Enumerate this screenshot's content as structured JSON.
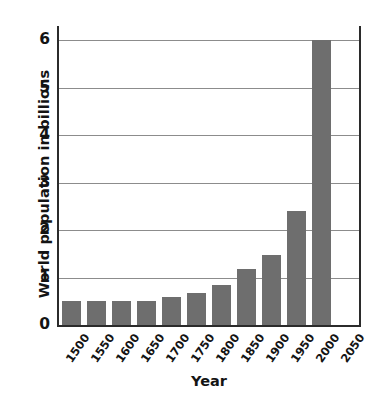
{
  "chart_data": {
    "type": "bar",
    "title": "",
    "xlabel": "Year",
    "ylabel": "World population in billions",
    "categories": [
      "1500",
      "1550",
      "1600",
      "1650",
      "1700",
      "1750",
      "1800",
      "1850",
      "1900",
      "1950",
      "2000",
      "2050"
    ],
    "values": [
      0.5,
      0.5,
      0.5,
      0.5,
      0.58,
      0.68,
      0.85,
      1.17,
      1.47,
      2.4,
      6.0,
      null
    ],
    "ylim": [
      0,
      6.3
    ],
    "ytick_labels": [
      "0",
      "1",
      "2",
      "3",
      "4",
      "5",
      "6"
    ],
    "ytick_values": [
      0,
      1,
      2,
      3,
      4,
      5,
      6
    ],
    "grid": true,
    "legend": "none",
    "bar_color": "#6e6e6e",
    "gridline_color": "#8c8c8c",
    "axis_color": "#2b2b2b",
    "background_color": "#ffffff"
  }
}
